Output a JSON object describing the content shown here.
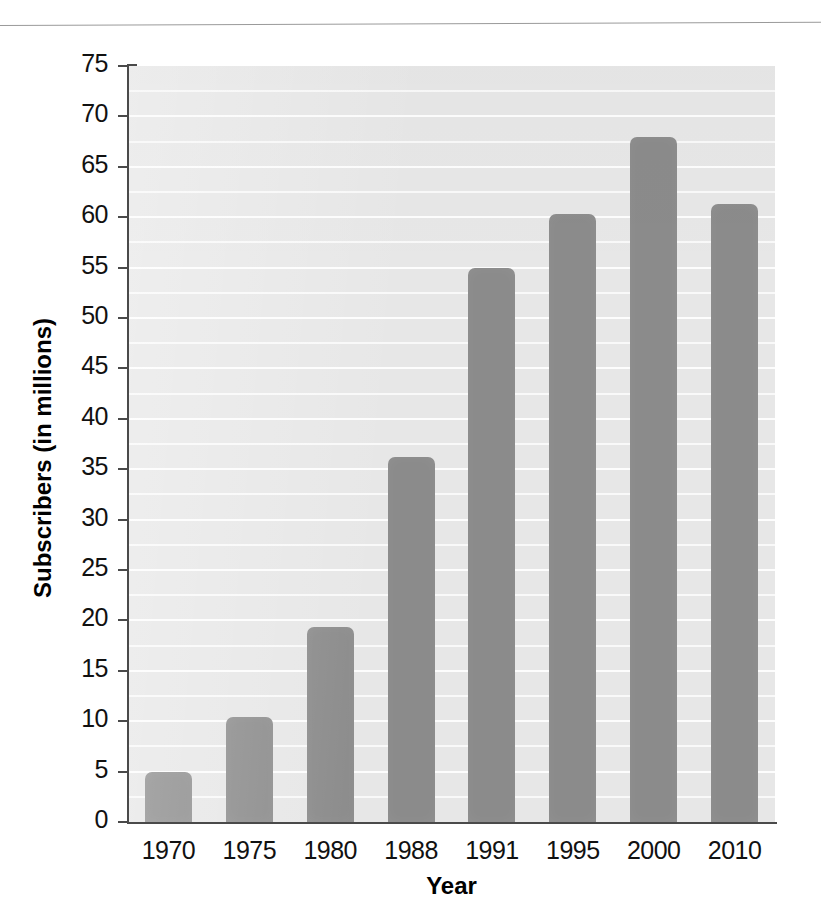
{
  "chart_data": {
    "type": "bar",
    "title": "",
    "subtitle": "",
    "xlabel": "Year",
    "ylabel": "Subscribers (in millions)",
    "categories": [
      "1970",
      "1975",
      "1980",
      "1988",
      "1991",
      "1995",
      "2000",
      "2010"
    ],
    "values": [
      5.0,
      10.4,
      19.3,
      36.2,
      55.0,
      60.3,
      68.0,
      61.3
    ],
    "series": [
      {
        "name": "Subscribers",
        "values": [
          5.0,
          10.4,
          19.3,
          36.2,
          55.0,
          60.3,
          68.0,
          61.3
        ]
      }
    ],
    "ylim": [
      0,
      75
    ],
    "ytick_labels": [
      "0",
      "5",
      "10",
      "15",
      "20",
      "25",
      "30",
      "35",
      "40",
      "45",
      "50",
      "55",
      "60",
      "65",
      "70",
      "75"
    ],
    "ytick_values": [
      0,
      5,
      10,
      15,
      20,
      25,
      30,
      35,
      40,
      45,
      50,
      55,
      60,
      65,
      70,
      75
    ],
    "ytick_step": 5,
    "gridline_step": 2.5,
    "grid": true,
    "grid_orientation": "horizontal",
    "legend": "none",
    "bar_color": "#8b8b8b",
    "plot_background": "#e7e7e7",
    "gridline_color": "#fdfdfd",
    "axis_color": "#4a4a4a",
    "text_color": "#111111"
  }
}
